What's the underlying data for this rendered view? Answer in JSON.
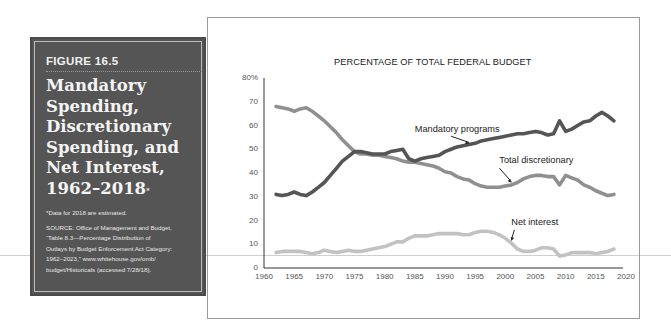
{
  "figure": {
    "label": "FIGURE 16.5",
    "title_lines": [
      "Mandatory",
      "Spending,",
      "Discretionary",
      "Spending, and",
      "Net Interest,",
      "1962–2018"
    ],
    "title_asterisk": "*",
    "note": "*Data for 2018 are estimated.",
    "source_lines": [
      "SOURCE: Office of Management and Budget,",
      "“Table 8.3—Percentage Distribution of",
      "Outlays by Budget Enforcement Act Category:",
      "1962–2023,” www.whitehouse.gov/omb/",
      "budget/Historicals (accessed 7/28/18)."
    ]
  },
  "colors": {
    "panel_bg": "#555555",
    "mandatory": "#555555",
    "discretionary": "#909090",
    "net_interest": "#c2c2c2",
    "axis": "#333333"
  },
  "chart_data": {
    "type": "line",
    "title": "PERCENTAGE OF TOTAL FEDERAL BUDGET",
    "xlabel": "",
    "ylabel": "",
    "xlim": [
      1960,
      2020
    ],
    "ylim": [
      0,
      80
    ],
    "x_ticks": [
      "1960",
      "1965",
      "1970",
      "1975",
      "1980",
      "1985",
      "1990",
      "1995",
      "2000",
      "2005",
      "2010",
      "2015",
      "2020"
    ],
    "y_ticks": [
      "0",
      "10",
      "20",
      "30",
      "40",
      "50",
      "60",
      "70",
      "80%"
    ],
    "grid": false,
    "legend": "inline annotations",
    "series": [
      {
        "name": "Mandatory programs",
        "x": [
          1962,
          1963,
          1964,
          1965,
          1966,
          1967,
          1968,
          1969,
          1970,
          1971,
          1972,
          1973,
          1974,
          1975,
          1976,
          1977,
          1978,
          1979,
          1980,
          1981,
          1982,
          1983,
          1984,
          1985,
          1986,
          1987,
          1988,
          1989,
          1990,
          1991,
          1992,
          1993,
          1994,
          1995,
          1996,
          1997,
          1998,
          1999,
          2000,
          2001,
          2002,
          2003,
          2004,
          2005,
          2006,
          2007,
          2008,
          2009,
          2010,
          2011,
          2012,
          2013,
          2014,
          2015,
          2016,
          2017,
          2018
        ],
        "values": [
          31,
          30.5,
          31,
          32,
          31,
          30.5,
          32,
          34,
          36,
          39,
          42,
          45,
          47,
          49,
          49,
          48.5,
          48,
          48,
          48,
          49,
          49.5,
          50,
          46,
          45,
          46,
          46.5,
          47,
          47.5,
          49,
          50,
          51,
          51.5,
          52,
          52.5,
          53.5,
          54,
          54.5,
          55,
          55.5,
          56,
          56.5,
          56.5,
          57,
          57.5,
          57,
          56,
          56.5,
          62,
          57.5,
          58.5,
          60,
          61.5,
          62,
          64,
          65.5,
          64,
          62
        ]
      },
      {
        "name": "Total discretionary",
        "x": [
          1962,
          1963,
          1964,
          1965,
          1966,
          1967,
          1968,
          1969,
          1970,
          1971,
          1972,
          1973,
          1974,
          1975,
          1976,
          1977,
          1978,
          1979,
          1980,
          1981,
          1982,
          1983,
          1984,
          1985,
          1986,
          1987,
          1988,
          1989,
          1990,
          1991,
          1992,
          1993,
          1994,
          1995,
          1996,
          1997,
          1998,
          1999,
          2000,
          2001,
          2002,
          2003,
          2004,
          2005,
          2006,
          2007,
          2008,
          2009,
          2010,
          2011,
          2012,
          2013,
          2014,
          2015,
          2016,
          2017,
          2018
        ],
        "values": [
          68,
          67.5,
          67,
          66,
          67,
          67.5,
          66,
          64,
          62,
          59.5,
          57,
          54,
          51.5,
          49,
          48,
          48,
          47.5,
          47.5,
          47,
          46.5,
          46,
          45,
          44.5,
          44.5,
          44,
          43.5,
          43,
          42,
          40.5,
          40,
          38.5,
          37.5,
          37,
          35.5,
          34.5,
          34,
          34,
          34,
          34.5,
          35,
          36,
          37.5,
          38.5,
          39,
          39,
          38.5,
          38.5,
          35,
          39,
          38,
          37,
          35,
          34,
          32.5,
          31.5,
          30.5,
          31
        ]
      },
      {
        "name": "Net interest",
        "x": [
          1962,
          1963,
          1964,
          1965,
          1966,
          1967,
          1968,
          1969,
          1970,
          1971,
          1972,
          1973,
          1974,
          1975,
          1976,
          1977,
          1978,
          1979,
          1980,
          1981,
          1982,
          1983,
          1984,
          1985,
          1986,
          1987,
          1988,
          1989,
          1990,
          1991,
          1992,
          1993,
          1994,
          1995,
          1996,
          1997,
          1998,
          1999,
          2000,
          2001,
          2002,
          2003,
          2004,
          2005,
          2006,
          2007,
          2008,
          2009,
          2010,
          2011,
          2012,
          2013,
          2014,
          2015,
          2016,
          2017,
          2018
        ],
        "values": [
          6.5,
          7,
          7,
          7,
          7,
          6.5,
          6,
          6.5,
          7.5,
          7,
          6.5,
          7,
          7.5,
          7,
          7,
          7.5,
          8,
          8.5,
          9,
          10,
          11,
          11,
          12.5,
          13.5,
          13.5,
          13.5,
          14,
          14.5,
          14.5,
          14.5,
          14.5,
          14,
          14,
          15,
          15.5,
          15.5,
          15,
          14,
          12.5,
          10.5,
          8,
          7,
          7,
          7.5,
          8.5,
          8.5,
          8,
          5,
          5.5,
          6.5,
          6.5,
          6.5,
          6.5,
          6,
          6.5,
          7,
          8
        ]
      }
    ],
    "annotations": [
      {
        "text": "Mandatory programs",
        "x": 1985,
        "y": 58,
        "arrow_to": [
          1994,
          52
        ]
      },
      {
        "text": "Total discretionary",
        "x": 1999,
        "y": 45,
        "arrow_to": [
          2001,
          35.5
        ]
      },
      {
        "text": "Net interest",
        "x": 2001,
        "y": 19,
        "arrow_to": [
          2001,
          11
        ]
      }
    ]
  }
}
